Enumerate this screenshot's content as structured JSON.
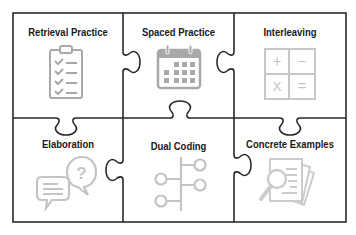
{
  "diagram": {
    "type": "puzzle-grid",
    "rows": 2,
    "cols": 3,
    "colors": {
      "outline": "#2a2a2a",
      "icon": "#a8a8a8",
      "text": "#1a1a1a",
      "background": "#ffffff"
    },
    "pieces": [
      {
        "label": "Retrieval Practice",
        "icon": "clipboard-checklist-icon"
      },
      {
        "label": "Spaced Practice",
        "icon": "calendar-icon"
      },
      {
        "label": "Interleaving",
        "icon": "math-operators-grid-icon"
      },
      {
        "label": "Elaboration",
        "icon": "speech-bubbles-question-icon"
      },
      {
        "label": "Dual Coding",
        "icon": "node-branch-icon"
      },
      {
        "label": "Concrete Examples",
        "icon": "document-magnifier-icon"
      }
    ],
    "interleaving_symbols": [
      "+",
      "−",
      "X",
      "="
    ],
    "elaboration_symbol": "?"
  }
}
